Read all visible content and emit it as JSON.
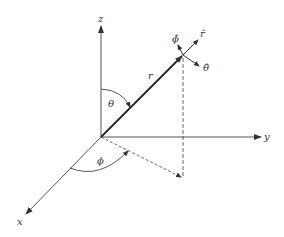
{
  "diagram": {
    "axes": {
      "x": "x",
      "y": "y",
      "z": "z"
    },
    "vector_label": "r",
    "angles": {
      "polar": "θ",
      "azimuthal": "ϕ"
    },
    "unit_vectors": {
      "r_hat": "r̂",
      "theta_hat": "θ̂",
      "phi_hat": "ϕ̂"
    },
    "colors": {
      "line": "#333333",
      "background": "#ffffff"
    }
  }
}
